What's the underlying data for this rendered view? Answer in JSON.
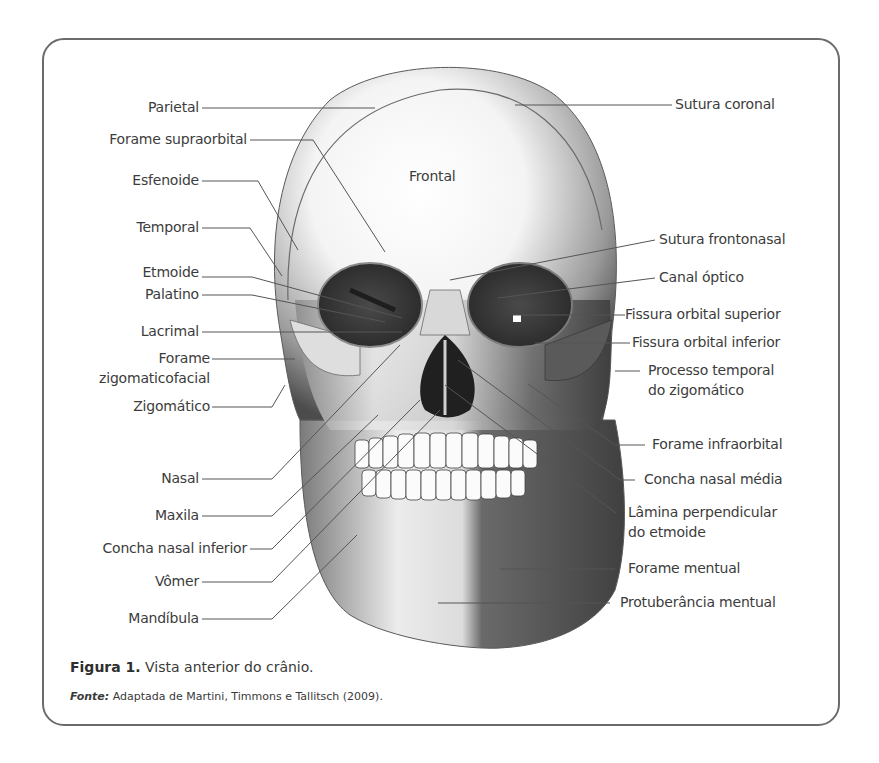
{
  "figure": {
    "caption_label": "Figura 1.",
    "caption_text": "Vista anterior do crânio.",
    "source_label": "Fonte:",
    "source_text": "Adaptada de Martini, Timmons e Tallitsch (2009)."
  },
  "skull": {
    "center_label": "Frontal"
  },
  "labels_left": [
    {
      "id": "parietal",
      "text": "Parietal"
    },
    {
      "id": "forame-supraorbital",
      "text": "Forame supraorbital"
    },
    {
      "id": "esfenoide",
      "text": "Esfenoide"
    },
    {
      "id": "temporal",
      "text": "Temporal"
    },
    {
      "id": "etmoide",
      "text": "Etmoide"
    },
    {
      "id": "palatino",
      "text": "Palatino"
    },
    {
      "id": "lacrimal",
      "text": "Lacrimal"
    },
    {
      "id": "forame-zigomaticofacial",
      "text": "Forame",
      "text2": "zigomaticofacial"
    },
    {
      "id": "zigomatico",
      "text": "Zigomático"
    },
    {
      "id": "nasal",
      "text": "Nasal"
    },
    {
      "id": "maxila",
      "text": "Maxila"
    },
    {
      "id": "concha-nasal-inferior",
      "text": "Concha nasal inferior"
    },
    {
      "id": "vomer",
      "text": "Vômer"
    },
    {
      "id": "mandibula",
      "text": "Mandíbula"
    }
  ],
  "labels_right": [
    {
      "id": "sutura-coronal",
      "text": "Sutura coronal"
    },
    {
      "id": "sutura-frontonasal",
      "text": "Sutura frontonasal"
    },
    {
      "id": "canal-optico",
      "text": "Canal óptico"
    },
    {
      "id": "fissura-orbital-superior",
      "text": "Fissura orbital superior"
    },
    {
      "id": "fissura-orbital-inferior",
      "text": "Fissura orbital inferior"
    },
    {
      "id": "processo-temporal",
      "text": "Processo temporal",
      "text2": "do zigomático"
    },
    {
      "id": "forame-infraorbital",
      "text": "Forame infraorbital"
    },
    {
      "id": "concha-nasal-media",
      "text": "Concha nasal média"
    },
    {
      "id": "lamina-perpendicular",
      "text": "Lâmina perpendicular",
      "text2": "do etmoide"
    },
    {
      "id": "forame-mentual",
      "text": "Forame mentual"
    },
    {
      "id": "protuberancia-mentual",
      "text": "Protuberância mentual"
    }
  ],
  "colors": {
    "border": "#6b6b6b",
    "text": "#3a3a3a",
    "leader_line": "#555555",
    "bone_light": "#f2f2f2",
    "bone_mid": "#b0b0b0",
    "bone_dark": "#4a4a4a"
  }
}
